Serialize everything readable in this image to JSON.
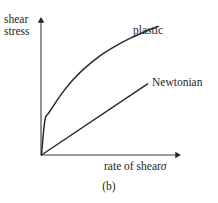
{
  "figure": {
    "caption": "(b)",
    "background_color": "#ffffff",
    "ink_color": "#262626"
  },
  "axes": {
    "y_label_line1": "shear",
    "y_label_line2": "stress",
    "x_label_text": "rate of shear",
    "x_label_symbol": "σ"
  },
  "labels": {
    "plastic": "plastic",
    "newtonian": "Newtonian"
  },
  "chart_data": {
    "type": "line",
    "title": "(b)",
    "xlabel": "rate of shear σ",
    "ylabel": "shear stress",
    "grid": false,
    "legend": "inline-curve-labels",
    "axis_arrows": true,
    "tick_labels": [],
    "xlim": [
      0,
      1
    ],
    "ylim": [
      0,
      1
    ],
    "annotations": [
      {
        "text": "plastic",
        "x": 0.67,
        "y": 0.88
      },
      {
        "text": "Newtonian",
        "x": 0.82,
        "y": 0.52
      }
    ],
    "series": [
      {
        "name": "plastic",
        "description": "yield stress then concave-down shear-thinning curve",
        "x": [
          0.0,
          0.01,
          0.02,
          0.03,
          0.05,
          0.09,
          0.15,
          0.23,
          0.32,
          0.43,
          0.54,
          0.65,
          0.76,
          0.86
        ],
        "y": [
          0.0,
          0.12,
          0.22,
          0.28,
          0.31,
          0.37,
          0.46,
          0.56,
          0.65,
          0.74,
          0.81,
          0.87,
          0.92,
          0.96
        ]
      },
      {
        "name": "Newtonian",
        "description": "straight line through the origin, constant viscosity",
        "x": [
          0.0,
          0.2,
          0.4,
          0.6,
          0.78
        ],
        "y": [
          0.0,
          0.14,
          0.28,
          0.41,
          0.53
        ]
      }
    ]
  }
}
